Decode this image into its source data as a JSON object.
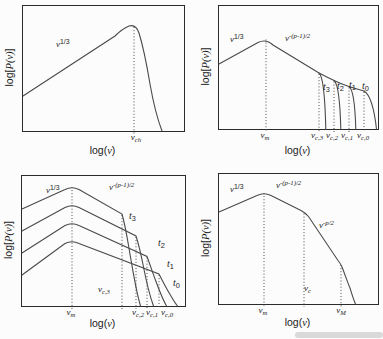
{
  "figure": {
    "background": "#fcfcfc",
    "curve_color": "#4a4a4a",
    "axis_color": "#2b2b2b",
    "text_color": "#1b1b1b"
  },
  "axes": {
    "ylabel": {
      "pre": "log[",
      "math": "P(ν)",
      "post": "]"
    },
    "xlabel": {
      "pre": "log(",
      "math": "ν",
      "post": ")"
    }
  },
  "panels": [
    {
      "name": "top-left",
      "slope_labels": [
        {
          "base": "ν",
          "exp": "1/3"
        }
      ],
      "xtick_labels": [
        {
          "base": "ν",
          "sub": "ch"
        }
      ],
      "curves": [
        {
          "d": "M0 90 L92 30 Q99 23 106 20 C111 18.5 114 21 116 27 C120 40 124 60 127 78 C130 95 134 112 139 125"
        }
      ],
      "dotted": [
        {
          "x": 111,
          "y1": 21,
          "y2": 128
        }
      ]
    },
    {
      "name": "top-right",
      "slope_labels": [
        {
          "base": "ν",
          "exp": "1/3"
        },
        {
          "base": "ν",
          "exp": "-(p-1)/2"
        }
      ],
      "curve_labels": [
        {
          "base": "t",
          "sub": "3"
        },
        {
          "base": "t",
          "sub": "2"
        },
        {
          "base": "t",
          "sub": "1"
        },
        {
          "base": "t",
          "sub": "0"
        }
      ],
      "xtick_labels": [
        {
          "base": "ν",
          "sub": "m"
        },
        {
          "base": "ν",
          "sub": "c,3"
        },
        {
          "base": "ν",
          "sub": "c,2"
        },
        {
          "base": "ν",
          "sub": "c,1"
        },
        {
          "base": "ν",
          "sub": "c,0"
        }
      ],
      "curves": [
        {
          "d": "M0 58 L39 36.5 Q47 32.5 54 39 L100 67 Q120 77.5 130 80.5 Q137 82.8 145 85"
        },
        {
          "d": "M100 67 C104 70 106 88 106.8 123"
        },
        {
          "d": "M115 74.5 C119 77.5 121 92 121.8 123"
        },
        {
          "d": "M130 80.5 C134 83 136 96 136.8 123"
        },
        {
          "d": "M145 85 C151 88.5 155 101 157.5 123"
        }
      ],
      "dotted": [
        {
          "x": 47,
          "y1": 33.5,
          "y2": 126
        },
        {
          "x": 100,
          "y1": 68,
          "y2": 126
        },
        {
          "x": 115,
          "y1": 75.5,
          "y2": 126
        },
        {
          "x": 130,
          "y1": 81.5,
          "y2": 126
        },
        {
          "x": 145,
          "y1": 86,
          "y2": 126
        }
      ]
    },
    {
      "name": "bottom-left",
      "slope_labels": [
        {
          "base": "ν",
          "exp": "1/3"
        },
        {
          "base": "ν",
          "exp": "-(p-1)/2"
        }
      ],
      "curve_labels": [
        {
          "base": "t",
          "sub": "3"
        },
        {
          "base": "t",
          "sub": "2"
        },
        {
          "base": "t",
          "sub": "1"
        },
        {
          "base": "t",
          "sub": "0"
        }
      ],
      "inner_freq_labels": [
        {
          "base": "ν",
          "sub": "c,3"
        }
      ],
      "xtick_labels": [
        {
          "base": "ν",
          "sub": "m"
        },
        {
          "base": "ν",
          "sub": "c,2"
        },
        {
          "base": "ν",
          "sub": "c,1"
        },
        {
          "base": "ν",
          "sub": "c,0"
        }
      ],
      "curves": [
        {
          "d": "M0 33 L43 13.5 Q50 10 57 13.5 L100 38 C104 52 106 67 108.5 81 C111.5 98 114 115 118.5 130"
        },
        {
          "d": "M0 55 L43 31.5 Q50 28 57 31.5 L114 60 C117.5 71 119.5 81 121 88.5 C124 104 127.5 119 131.5 130"
        },
        {
          "d": "M0 77 L43 49.5 Q50 46 57 49.5 L125 80.5 C128.5 90 131.5 99 134 105.5 C137.5 115 140.5 123 144.5 130"
        },
        {
          "d": "M0 99 L43 67.5 Q50 64 57 67.5 L137 98 C141 106 144.5 112.5 147.5 117.5 C150.5 122.5 152.5 126.5 155.5 130"
        }
      ],
      "dotted": [
        {
          "x": 50,
          "y1": 11,
          "y2": 133
        },
        {
          "x": 100,
          "y1": 39,
          "y2": 133
        },
        {
          "x": 114,
          "y1": 61,
          "y2": 133
        },
        {
          "x": 125,
          "y1": 81.5,
          "y2": 133
        },
        {
          "x": 137,
          "y1": 99,
          "y2": 133
        }
      ]
    },
    {
      "name": "bottom-right",
      "slope_labels": [
        {
          "base": "ν",
          "exp": "1/3"
        },
        {
          "base": "ν",
          "exp": "-(p-1)/2"
        },
        {
          "base": "ν",
          "exp": "-p/2"
        }
      ],
      "inner_freq_labels": [
        {
          "base": "ν",
          "sub": "c"
        }
      ],
      "xtick_labels": [
        {
          "base": "ν",
          "sub": "m"
        },
        {
          "base": "ν",
          "sub": "M"
        }
      ],
      "curves": [
        {
          "d": "M0 38 L38 21.5 Q45 18 52 21.5 L82 36.5 Q86 38.5 89.5 42.5 L119 86.5 Q121.5 89.5 123 93 C126.5 102 129 109.5 131 114 C133 120.5 134.5 125.5 136.5 130"
        }
      ],
      "dotted": [
        {
          "x": 45,
          "y1": 19,
          "y2": 133
        },
        {
          "x": 85,
          "y1": 39.5,
          "y2": 133
        },
        {
          "x": 122,
          "y1": 91,
          "y2": 133
        }
      ]
    }
  ],
  "chart_data": [
    {
      "type": "line",
      "panel": "top-left",
      "title": "",
      "xlabel": "log(ν)",
      "ylabel": "log[P(ν)]",
      "xscale": "log",
      "yscale": "log",
      "grid": false,
      "series": [
        {
          "name": "single spectrum",
          "segments": [
            {
              "range": "ν < ν_ch",
              "form": "ν^(1/3)"
            },
            {
              "range": "ν > ν_ch",
              "form": "sharp exponential cutoff"
            }
          ],
          "peak_frequency": "ν_ch"
        }
      ],
      "annotations": [
        "ν^(1/3)",
        "ν_ch"
      ]
    },
    {
      "type": "line",
      "panel": "top-right",
      "title": "",
      "xlabel": "log(ν)",
      "ylabel": "log[P(ν)]",
      "xscale": "log",
      "yscale": "log",
      "grid": false,
      "common_segments": [
        {
          "range": "ν < ν_m",
          "form": "ν^(1/3)"
        },
        {
          "range": "ν_m < ν < ν_c,i",
          "form": "ν^(-(p-1)/2)"
        }
      ],
      "series": [
        {
          "name": "t_3",
          "cutoff_frequency": "ν_c,3"
        },
        {
          "name": "t_2",
          "cutoff_frequency": "ν_c,2"
        },
        {
          "name": "t_1",
          "cutoff_frequency": "ν_c,1"
        },
        {
          "name": "t_0",
          "cutoff_frequency": "ν_c,0"
        }
      ],
      "frequency_order": "ν_m < ν_c,3 < ν_c,2 < ν_c,1 < ν_c,0",
      "annotations": [
        "ν^(1/3)",
        "ν^(-(p-1)/2)",
        "t_3",
        "t_2",
        "t_1",
        "t_0",
        "ν_m",
        "ν_c,3",
        "ν_c,2",
        "ν_c,1",
        "ν_c,0"
      ]
    },
    {
      "type": "line",
      "panel": "bottom-left",
      "title": "",
      "xlabel": "log(ν)",
      "ylabel": "log[P(ν)]",
      "xscale": "log",
      "yscale": "log",
      "grid": false,
      "common_segments": [
        {
          "range": "ν < ν_m",
          "form": "ν^(1/3)"
        },
        {
          "range": "ν_m < ν < ν_c,i",
          "form": "ν^(-(p-1)/2)"
        }
      ],
      "series": [
        {
          "name": "t_3",
          "amplitude_rank": 1,
          "cutoff_frequency": "ν_c,3"
        },
        {
          "name": "t_2",
          "amplitude_rank": 2,
          "cutoff_frequency": "ν_c,2"
        },
        {
          "name": "t_1",
          "amplitude_rank": 3,
          "cutoff_frequency": "ν_c,1"
        },
        {
          "name": "t_0",
          "amplitude_rank": 4,
          "cutoff_frequency": "ν_c,0"
        }
      ],
      "shared_peak_frequency": "ν_m",
      "annotations": [
        "ν^(1/3)",
        "ν^(-(p-1)/2)",
        "t_3",
        "t_2",
        "t_1",
        "t_0",
        "ν_m",
        "ν_c,3",
        "ν_c,2",
        "ν_c,1",
        "ν_c,0"
      ]
    },
    {
      "type": "line",
      "panel": "bottom-right",
      "title": "",
      "xlabel": "log(ν)",
      "ylabel": "log[P(ν)]",
      "xscale": "log",
      "yscale": "log",
      "grid": false,
      "series": [
        {
          "name": "broken power-law spectrum",
          "segments": [
            {
              "range": "ν < ν_m",
              "form": "ν^(1/3)"
            },
            {
              "range": "ν_m < ν < ν_c",
              "form": "ν^(-(p-1)/2)"
            },
            {
              "range": "ν_c < ν < ν_M",
              "form": "ν^(-p/2)"
            },
            {
              "range": "ν > ν_M",
              "form": "sharp cutoff"
            }
          ]
        }
      ],
      "break_frequencies": [
        "ν_m",
        "ν_c",
        "ν_M"
      ],
      "annotations": [
        "ν^(1/3)",
        "ν^(-(p-1)/2)",
        "ν^(-p/2)",
        "ν_m",
        "ν_c",
        "ν_M"
      ]
    }
  ]
}
